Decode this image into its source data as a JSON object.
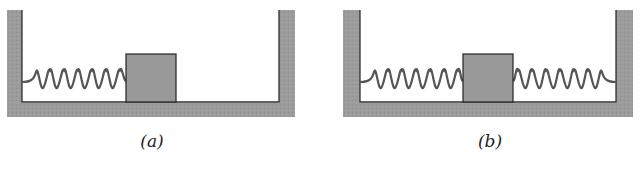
{
  "figure": {
    "panels": [
      {
        "id": "a",
        "label": "(a)",
        "description": "Block attached to left wall by one spring",
        "springs": [
          "left"
        ],
        "spring_coils": 7
      },
      {
        "id": "b",
        "label": "(b)",
        "description": "Block between two springs attached to both walls",
        "springs": [
          "left",
          "right"
        ],
        "spring_coils": 7
      }
    ],
    "colors": {
      "wall": "#9a9a9a",
      "block": "#999999",
      "outline": "#222222",
      "spring": "#555555"
    }
  }
}
